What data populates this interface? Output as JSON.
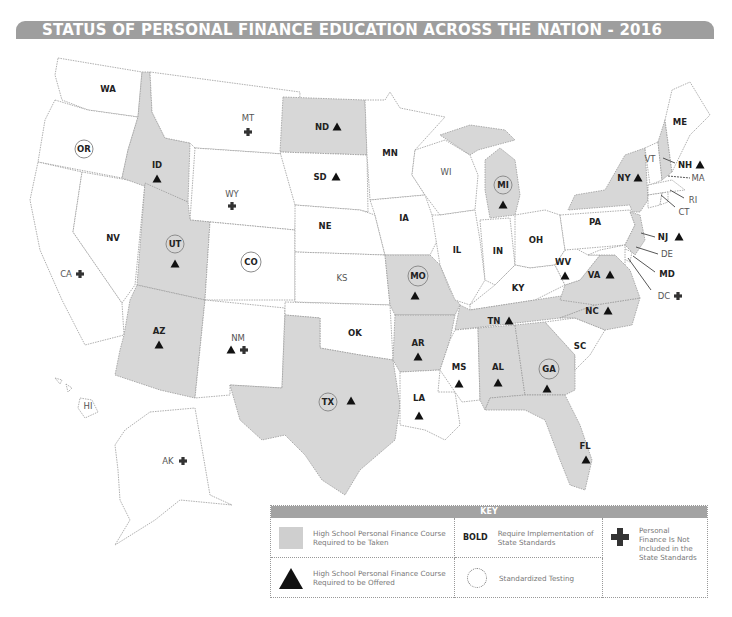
{
  "title": "STATUS OF PERSONAL FINANCE EDUCATION ACROSS THE NATION - 2016",
  "map": {
    "states": [
      {
        "abbr": "WA",
        "category": "none",
        "bold": true,
        "triangle": false,
        "testing": false,
        "not_included": false
      },
      {
        "abbr": "OR",
        "category": "none",
        "bold": true,
        "triangle": false,
        "testing": true,
        "not_included": false
      },
      {
        "abbr": "CA",
        "category": "none",
        "bold": false,
        "triangle": false,
        "testing": false,
        "not_included": true
      },
      {
        "abbr": "NV",
        "category": "none",
        "bold": true,
        "triangle": false,
        "testing": false,
        "not_included": false
      },
      {
        "abbr": "ID",
        "category": "required_taken",
        "bold": true,
        "triangle": true,
        "testing": false,
        "not_included": false
      },
      {
        "abbr": "MT",
        "category": "none",
        "bold": false,
        "triangle": false,
        "testing": false,
        "not_included": true
      },
      {
        "abbr": "WY",
        "category": "none",
        "bold": false,
        "triangle": false,
        "testing": false,
        "not_included": true
      },
      {
        "abbr": "UT",
        "category": "required_taken",
        "bold": true,
        "triangle": true,
        "testing": true,
        "not_included": false
      },
      {
        "abbr": "CO",
        "category": "none",
        "bold": true,
        "triangle": false,
        "testing": true,
        "not_included": false
      },
      {
        "abbr": "AZ",
        "category": "required_taken",
        "bold": true,
        "triangle": true,
        "testing": false,
        "not_included": false
      },
      {
        "abbr": "NM",
        "category": "none",
        "bold": false,
        "triangle": true,
        "testing": false,
        "not_included": true
      },
      {
        "abbr": "ND",
        "category": "required_taken",
        "bold": true,
        "triangle": true,
        "testing": false,
        "not_included": false
      },
      {
        "abbr": "SD",
        "category": "none",
        "bold": true,
        "triangle": true,
        "testing": false,
        "not_included": false
      },
      {
        "abbr": "NE",
        "category": "none",
        "bold": true,
        "triangle": false,
        "testing": false,
        "not_included": false
      },
      {
        "abbr": "KS",
        "category": "none",
        "bold": false,
        "triangle": false,
        "testing": false,
        "not_included": false
      },
      {
        "abbr": "OK",
        "category": "none",
        "bold": true,
        "triangle": false,
        "testing": false,
        "not_included": false
      },
      {
        "abbr": "TX",
        "category": "required_taken",
        "bold": true,
        "triangle": true,
        "testing": true,
        "not_included": false
      },
      {
        "abbr": "MN",
        "category": "none",
        "bold": true,
        "triangle": false,
        "testing": false,
        "not_included": false
      },
      {
        "abbr": "IA",
        "category": "none",
        "bold": true,
        "triangle": false,
        "testing": false,
        "not_included": false
      },
      {
        "abbr": "MO",
        "category": "required_taken",
        "bold": true,
        "triangle": true,
        "testing": true,
        "not_included": false
      },
      {
        "abbr": "AR",
        "category": "required_taken",
        "bold": true,
        "triangle": true,
        "testing": false,
        "not_included": false
      },
      {
        "abbr": "LA",
        "category": "none",
        "bold": true,
        "triangle": true,
        "testing": false,
        "not_included": false
      },
      {
        "abbr": "WI",
        "category": "none",
        "bold": false,
        "triangle": false,
        "testing": false,
        "not_included": false
      },
      {
        "abbr": "IL",
        "category": "none",
        "bold": true,
        "triangle": false,
        "testing": false,
        "not_included": false
      },
      {
        "abbr": "MI",
        "category": "required_taken",
        "bold": true,
        "triangle": true,
        "testing": true,
        "not_included": false
      },
      {
        "abbr": "IN",
        "category": "none",
        "bold": true,
        "triangle": false,
        "testing": false,
        "not_included": false
      },
      {
        "abbr": "OH",
        "category": "none",
        "bold": true,
        "triangle": false,
        "testing": false,
        "not_included": false
      },
      {
        "abbr": "KY",
        "category": "none",
        "bold": true,
        "triangle": false,
        "testing": false,
        "not_included": false
      },
      {
        "abbr": "TN",
        "category": "required_taken",
        "bold": true,
        "triangle": true,
        "testing": false,
        "not_included": false
      },
      {
        "abbr": "MS",
        "category": "none",
        "bold": true,
        "triangle": true,
        "testing": false,
        "not_included": false
      },
      {
        "abbr": "AL",
        "category": "required_taken",
        "bold": true,
        "triangle": true,
        "testing": false,
        "not_included": false
      },
      {
        "abbr": "GA",
        "category": "required_taken",
        "bold": true,
        "triangle": true,
        "testing": true,
        "not_included": false
      },
      {
        "abbr": "FL",
        "category": "required_taken",
        "bold": true,
        "triangle": true,
        "testing": false,
        "not_included": false
      },
      {
        "abbr": "SC",
        "category": "none",
        "bold": true,
        "triangle": false,
        "testing": false,
        "not_included": false
      },
      {
        "abbr": "NC",
        "category": "required_taken",
        "bold": true,
        "triangle": true,
        "testing": false,
        "not_included": false
      },
      {
        "abbr": "VA",
        "category": "required_taken",
        "bold": true,
        "triangle": true,
        "testing": false,
        "not_included": false
      },
      {
        "abbr": "WV",
        "category": "none",
        "bold": true,
        "triangle": true,
        "testing": false,
        "not_included": false
      },
      {
        "abbr": "PA",
        "category": "none",
        "bold": true,
        "triangle": false,
        "testing": false,
        "not_included": false
      },
      {
        "abbr": "NY",
        "category": "required_taken",
        "bold": true,
        "triangle": true,
        "testing": false,
        "not_included": false
      },
      {
        "abbr": "NJ",
        "category": "required_taken",
        "bold": true,
        "triangle": true,
        "testing": false,
        "not_included": false
      },
      {
        "abbr": "DE",
        "category": "none",
        "bold": false,
        "triangle": false,
        "testing": false,
        "not_included": false
      },
      {
        "abbr": "MD",
        "category": "none",
        "bold": true,
        "triangle": false,
        "testing": false,
        "not_included": false
      },
      {
        "abbr": "DC",
        "category": "none",
        "bold": false,
        "triangle": false,
        "testing": false,
        "not_included": true
      },
      {
        "abbr": "CT",
        "category": "none",
        "bold": false,
        "triangle": false,
        "testing": false,
        "not_included": false
      },
      {
        "abbr": "RI",
        "category": "none",
        "bold": false,
        "triangle": false,
        "testing": false,
        "not_included": false
      },
      {
        "abbr": "MA",
        "category": "none",
        "bold": false,
        "triangle": false,
        "testing": false,
        "not_included": false
      },
      {
        "abbr": "VT",
        "category": "none",
        "bold": false,
        "triangle": false,
        "testing": false,
        "not_included": false
      },
      {
        "abbr": "NH",
        "category": "required_taken",
        "bold": true,
        "triangle": true,
        "testing": false,
        "not_included": false
      },
      {
        "abbr": "ME",
        "category": "none",
        "bold": true,
        "triangle": false,
        "testing": false,
        "not_included": false
      },
      {
        "abbr": "AK",
        "category": "none",
        "bold": false,
        "triangle": false,
        "testing": false,
        "not_included": true
      },
      {
        "abbr": "HI",
        "category": "none",
        "bold": false,
        "triangle": false,
        "testing": false,
        "not_included": false
      }
    ],
    "labels": {
      "WA": "WA",
      "OR": "OR",
      "CA": "CA",
      "NV": "NV",
      "ID": "ID",
      "MT": "MT",
      "WY": "WY",
      "UT": "UT",
      "CO": "CO",
      "AZ": "AZ",
      "NM": "NM",
      "ND": "ND",
      "SD": "SD",
      "NE": "NE",
      "KS": "KS",
      "OK": "OK",
      "TX": "TX",
      "MN": "MN",
      "IA": "IA",
      "MO": "MO",
      "AR": "AR",
      "LA": "LA",
      "WI": "WI",
      "IL": "IL",
      "MI": "MI",
      "IN": "IN",
      "OH": "OH",
      "KY": "KY",
      "TN": "TN",
      "MS": "MS",
      "AL": "AL",
      "GA": "GA",
      "FL": "FL",
      "SC": "SC",
      "NC": "NC",
      "VA": "VA",
      "WV": "WV",
      "PA": "PA",
      "NY": "NY",
      "NJ": "NJ",
      "DE": "DE",
      "MD": "MD",
      "DC": "DC",
      "CT": "CT",
      "RI": "RI",
      "MA": "MA",
      "VT": "VT",
      "NH": "NH",
      "ME": "ME",
      "AK": "AK",
      "HI": "HI"
    }
  },
  "colors": {
    "title_bar": "#9e9e9e",
    "required_taken_fill": "#d7d7d7",
    "default_fill": "#ffffff",
    "marker": "#111111"
  },
  "key": {
    "heading": "KEY",
    "items": [
      {
        "symbol": "gray-swatch",
        "text": "High School Personal Finance Course Required to be Taken"
      },
      {
        "symbol": "BOLD",
        "text": "Require Implementation of State Standards"
      },
      {
        "symbol": "plus",
        "text": "Personal Finance Is Not Included in the State Standards"
      },
      {
        "symbol": "triangle",
        "text": "High School Personal Finance Course Required to be Offered"
      },
      {
        "symbol": "circle",
        "text": "Standardized Testing"
      }
    ],
    "bold_tag": "BOLD"
  }
}
